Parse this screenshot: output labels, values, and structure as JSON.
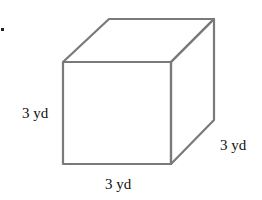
{
  "figure": {
    "shape": "cube",
    "labels": {
      "height": "3 yd",
      "depth": "3 yd",
      "width": "3 yd"
    },
    "colors": {
      "edge": "#7a7a7a",
      "text": "#111111",
      "background": "#ffffff"
    }
  }
}
